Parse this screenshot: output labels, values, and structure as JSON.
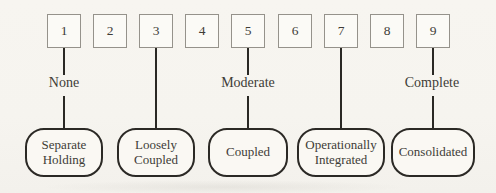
{
  "figure": {
    "type": "scale-diagram",
    "scale_numbers": [
      "1",
      "2",
      "3",
      "4",
      "5",
      "6",
      "7",
      "8",
      "9"
    ],
    "anchors": [
      {
        "text": "None",
        "scale_position": 1
      },
      {
        "text": "Moderate",
        "scale_position": 5
      },
      {
        "text": "Complete",
        "scale_position": 9
      }
    ],
    "stages": [
      {
        "label": "Separate Holding",
        "scale_position": 1
      },
      {
        "label": "Loosely Coupled",
        "scale_position": 3
      },
      {
        "label": "Coupled",
        "scale_position": 5
      },
      {
        "label": "Operationally Integrated",
        "scale_position": 7
      },
      {
        "label": "Consolidated",
        "scale_position": 9
      }
    ],
    "colors": {
      "background": "#f6f4ef",
      "ink": "#2a2824",
      "box_border": "#95928b",
      "box_fill": "#fbfaf6",
      "text": "#403c37"
    }
  }
}
